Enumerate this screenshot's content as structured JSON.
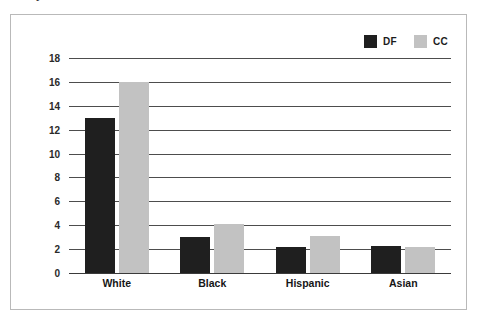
{
  "clipped_title_fragment": "y",
  "colors": {
    "series_df": "#1f1f1f",
    "series_cc": "#c2c2c2",
    "gridline": "#4d4d4d",
    "frame_border": "#b9b9b9",
    "axis_text": "#2a2a2a",
    "background": "#ffffff"
  },
  "legend": {
    "position": "top-right",
    "entries": [
      {
        "label": "DF",
        "color": "#1f1f1f",
        "swatch_name": "legend-swatch-df"
      },
      {
        "label": "CC",
        "color": "#c2c2c2",
        "swatch_name": "legend-swatch-cc"
      }
    ]
  },
  "chart_data": {
    "type": "bar",
    "title": "",
    "xlabel": "",
    "ylabel": "",
    "ylim": [
      0,
      18
    ],
    "ytick_step": 2,
    "yticks": [
      0,
      2,
      4,
      6,
      8,
      10,
      12,
      14,
      16,
      18
    ],
    "ytick_labels": [
      "0",
      "2",
      "4",
      "6",
      "8",
      "10",
      "12",
      "14",
      "16",
      "18"
    ],
    "grid": true,
    "grid_axis": "y",
    "legend_position": "top-right",
    "categories": [
      "White",
      "Black",
      "Hispanic",
      "Asian"
    ],
    "series": [
      {
        "name": "DF",
        "color": "#1f1f1f",
        "values": [
          13,
          3,
          2.2,
          2.25
        ]
      },
      {
        "name": "CC",
        "color": "#c2c2c2",
        "values": [
          16,
          4.1,
          3.1,
          2.2
        ]
      }
    ]
  }
}
